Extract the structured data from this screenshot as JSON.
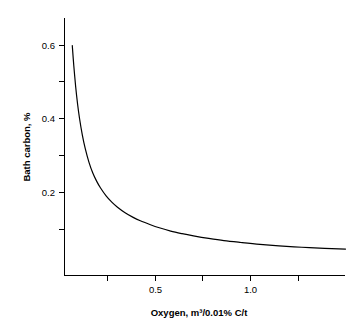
{
  "chart_data": {
    "type": "line",
    "title": "",
    "xlabel": "Oxygen, m³/0.01% C/t",
    "ylabel": "Bath carbon, %",
    "xlim": [
      0.04,
      1.5
    ],
    "ylim": [
      0.0,
      0.655
    ],
    "grid": false,
    "legend": null,
    "x_major_ticks": [
      0.5,
      1.0
    ],
    "x_major_tick_labels": [
      "0.5",
      "1.0"
    ],
    "x_all_tick_positions": [
      0.25,
      0.5,
      0.75,
      1.0,
      1.25
    ],
    "y_major_ticks": [
      0.2,
      0.4,
      0.6
    ],
    "y_major_tick_labels": [
      "0.2",
      "0.4",
      "0.6"
    ],
    "y_minor_ticks": [
      0.1,
      0.3,
      0.5
    ],
    "series": [
      {
        "name": "Bath carbon vs oxygen",
        "x": [
          0.062,
          0.07,
          0.08,
          0.09,
          0.1,
          0.115,
          0.13,
          0.15,
          0.17,
          0.19,
          0.21,
          0.24,
          0.27,
          0.3,
          0.34,
          0.38,
          0.42,
          0.47,
          0.52,
          0.58,
          0.64,
          0.7,
          0.78,
          0.86,
          0.95,
          1.05,
          1.15,
          1.27,
          1.39,
          1.5
        ],
        "y": [
          0.6,
          0.545,
          0.487,
          0.44,
          0.402,
          0.356,
          0.32,
          0.282,
          0.253,
          0.231,
          0.213,
          0.191,
          0.174,
          0.16,
          0.145,
          0.133,
          0.123,
          0.113,
          0.104,
          0.095,
          0.088,
          0.082,
          0.075,
          0.069,
          0.064,
          0.059,
          0.055,
          0.051,
          0.048,
          0.046
        ]
      }
    ],
    "asymptote_y": 0.045,
    "curve_start_point": {
      "x": 0.062,
      "y": 0.6
    },
    "curve_end_point": {
      "x": 1.5,
      "y": 0.046
    }
  },
  "style": {
    "line_color": "#000000",
    "axis_color": "#000000",
    "background": "#ffffff"
  }
}
